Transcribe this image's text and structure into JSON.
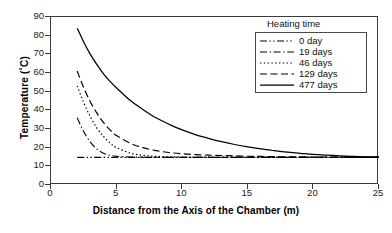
{
  "chart_data": {
    "type": "line",
    "title": "",
    "xlabel": "Distance from the Axis of the Chamber (m)",
    "ylabel": "Temperature (˚C)",
    "xlim": [
      0,
      25
    ],
    "ylim": [
      0,
      90
    ],
    "xticks": [
      0,
      5,
      10,
      15,
      20,
      25
    ],
    "yticks": [
      0,
      10,
      20,
      30,
      40,
      50,
      60,
      70,
      80,
      90
    ],
    "grid": false,
    "legend_position": "top-right",
    "legend_title": "Heating time",
    "x": [
      2,
      2.5,
      3,
      3.5,
      4,
      4.5,
      5,
      6,
      7,
      8,
      9,
      10,
      11,
      12,
      13,
      14,
      15,
      16,
      17,
      18,
      19,
      20,
      21,
      22,
      23,
      24,
      25
    ],
    "series": [
      {
        "name": "0 day",
        "dash": "dash-dot-dot",
        "values": [
          14.8,
          14.8,
          14.8,
          14.8,
          14.8,
          14.8,
          14.8,
          14.8,
          14.8,
          14.8,
          14.8,
          14.8,
          14.8,
          14.8,
          14.8,
          14.8,
          14.8,
          14.8,
          14.8,
          14.8,
          14.8,
          14.8,
          14.8,
          14.8,
          14.8,
          14.8,
          14.8
        ]
      },
      {
        "name": "19 days",
        "dash": "dash-dot",
        "values": [
          36.0,
          28.5,
          23.0,
          19.2,
          17.0,
          15.9,
          15.4,
          15.0,
          14.9,
          14.85,
          14.8,
          14.8,
          14.8,
          14.8,
          14.8,
          14.8,
          14.8,
          14.8,
          14.8,
          14.8,
          14.8,
          14.8,
          14.8,
          14.8,
          14.8,
          14.8,
          14.8
        ]
      },
      {
        "name": "46 days",
        "dash": "dotted",
        "values": [
          53.0,
          44.0,
          36.5,
          30.5,
          26.0,
          22.5,
          20.0,
          17.2,
          15.9,
          15.3,
          15.1,
          15.0,
          14.9,
          14.9,
          14.85,
          14.8,
          14.8,
          14.8,
          14.8,
          14.8,
          14.8,
          14.8,
          14.8,
          14.8,
          14.8,
          14.8,
          14.8
        ]
      },
      {
        "name": "129 days",
        "dash": "dashed",
        "values": [
          61.0,
          52.0,
          44.5,
          38.5,
          33.5,
          29.5,
          26.5,
          22.5,
          20.0,
          18.4,
          17.4,
          16.7,
          16.3,
          16.0,
          15.8,
          15.6,
          15.4,
          15.3,
          15.2,
          15.1,
          15.05,
          15.0,
          15.0,
          14.95,
          14.9,
          14.9,
          14.9
        ]
      },
      {
        "name": "477 days",
        "dash": "solid",
        "values": [
          84.0,
          76.5,
          70.0,
          64.5,
          59.5,
          55.5,
          52.0,
          45.5,
          40.5,
          36.0,
          32.5,
          29.5,
          27.0,
          25.0,
          23.2,
          21.7,
          20.4,
          19.3,
          18.4,
          17.6,
          17.0,
          16.4,
          16.0,
          15.6,
          15.3,
          15.1,
          15.0
        ]
      }
    ]
  },
  "axes": {
    "y_title": "Temperature (˚C)",
    "x_title": "Distance from the Axis of the Chamber (m)",
    "y_tick_labels": [
      "90",
      "80",
      "70",
      "60",
      "50",
      "40",
      "30",
      "20",
      "10",
      "0"
    ],
    "x_tick_labels": [
      "0",
      "5",
      "10",
      "15",
      "20",
      "25"
    ]
  },
  "legend": {
    "title": "Heating time",
    "items": [
      {
        "label": "0 day"
      },
      {
        "label": "19 days"
      },
      {
        "label": "46 days"
      },
      {
        "label": "129 days"
      },
      {
        "label": "477 days"
      }
    ]
  },
  "colors": {
    "line": "#000000",
    "axis": "#3a3a3a",
    "background": "#ffffff"
  }
}
